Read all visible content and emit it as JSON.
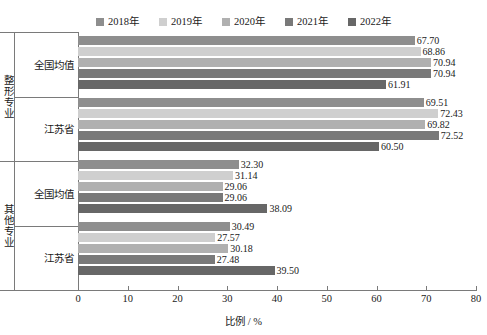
{
  "chart_data": {
    "type": "bar",
    "orientation": "horizontal",
    "title": "",
    "xlabel": "比例 / %",
    "ylabel": "",
    "xlim": [
      0,
      80
    ],
    "xticks": [
      0,
      10,
      20,
      30,
      40,
      50,
      60,
      70,
      80
    ],
    "grid": false,
    "legend_position": "top",
    "series": [
      {
        "name": "2018年",
        "color": "#8e8e8e",
        "values": [
          67.7,
          69.51,
          32.3,
          30.49
        ]
      },
      {
        "name": "2019年",
        "color": "#cfcfcf",
        "values": [
          68.86,
          72.43,
          31.14,
          27.57
        ]
      },
      {
        "name": "2020年",
        "color": "#b0b0b0",
        "values": [
          70.94,
          69.82,
          29.06,
          30.18
        ]
      },
      {
        "name": "2021年",
        "color": "#797979",
        "values": [
          70.94,
          72.52,
          29.06,
          27.48
        ]
      },
      {
        "name": "2022年",
        "color": "#676767",
        "values": [
          61.91,
          60.5,
          38.09,
          39.5
        ]
      }
    ],
    "categories": [
      {
        "outer": "整形专业",
        "inner": "全国均值"
      },
      {
        "outer": "整形专业",
        "inner": "江苏省"
      },
      {
        "outer": "其他专业",
        "inner": "全国均值"
      },
      {
        "outer": "其他专业",
        "inner": "江苏省"
      }
    ],
    "groups": [
      {
        "outer": "整形专业",
        "inner": "全国均值",
        "points": [
          {
            "series": "2018年",
            "value": 67.7,
            "label": "67.70"
          },
          {
            "series": "2019年",
            "value": 68.86,
            "label": "68.86"
          },
          {
            "series": "2020年",
            "value": 70.94,
            "label": "70.94"
          },
          {
            "series": "2021年",
            "value": 70.94,
            "label": "70.94"
          },
          {
            "series": "2022年",
            "value": 61.91,
            "label": "61.91"
          }
        ]
      },
      {
        "outer": "整形专业",
        "inner": "江苏省",
        "points": [
          {
            "series": "2018年",
            "value": 69.51,
            "label": "69.51"
          },
          {
            "series": "2019年",
            "value": 72.43,
            "label": "72.43"
          },
          {
            "series": "2020年",
            "value": 69.82,
            "label": "69.82"
          },
          {
            "series": "2021年",
            "value": 72.52,
            "label": "72.52"
          },
          {
            "series": "2022年",
            "value": 60.5,
            "label": "60.50"
          }
        ]
      },
      {
        "outer": "其他专业",
        "inner": "全国均值",
        "points": [
          {
            "series": "2018年",
            "value": 32.3,
            "label": "32.30"
          },
          {
            "series": "2019年",
            "value": 31.14,
            "label": "31.14"
          },
          {
            "series": "2020年",
            "value": 29.06,
            "label": "29.06"
          },
          {
            "series": "2021年",
            "value": 29.06,
            "label": "29.06"
          },
          {
            "series": "2022年",
            "value": 38.09,
            "label": "38.09"
          }
        ]
      },
      {
        "outer": "其他专业",
        "inner": "江苏省",
        "points": [
          {
            "series": "2018年",
            "value": 30.49,
            "label": "30.49"
          },
          {
            "series": "2019年",
            "value": 27.57,
            "label": "27.57"
          },
          {
            "series": "2020年",
            "value": 30.18,
            "label": "30.18"
          },
          {
            "series": "2021年",
            "value": 27.48,
            "label": "27.48"
          },
          {
            "series": "2022年",
            "value": 39.5,
            "label": "39.50"
          }
        ]
      }
    ]
  },
  "axis": {
    "x_title": "比例 / %",
    "tick_labels": [
      "0",
      "10",
      "20",
      "30",
      "40",
      "50",
      "60",
      "70",
      "80"
    ]
  },
  "legend": {
    "items": [
      "2018年",
      "2019年",
      "2020年",
      "2021年",
      "2022年"
    ]
  },
  "colors": {
    "axis": "#7a7a7a",
    "text": "#1a1a1a",
    "background": "#ffffff"
  }
}
